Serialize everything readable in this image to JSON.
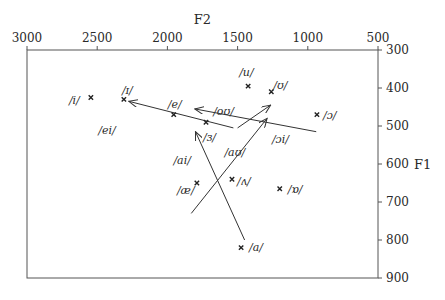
{
  "chart_data": {
    "type": "scatter",
    "title": "",
    "xlabel": "F2",
    "ylabel": "F1",
    "x_axis": {
      "position": "top",
      "reversed": true,
      "range": [
        3000,
        500
      ],
      "ticks": [
        3000,
        2500,
        2000,
        1500,
        1000,
        500
      ]
    },
    "y_axis": {
      "position": "right",
      "reversed": true,
      "range": [
        300,
        900
      ],
      "ticks": [
        300,
        400,
        500,
        600,
        700,
        800,
        900
      ]
    },
    "grid": false,
    "legend": null,
    "vowels": [
      {
        "label": "/i/",
        "F2": 2545,
        "F1": 425,
        "label_dx": -22,
        "label_dy": 6
      },
      {
        "label": "/ɪ/",
        "F2": 2310,
        "F1": 430,
        "label_dx": -2,
        "label_dy": -5
      },
      {
        "label": "/e/",
        "F2": 1955,
        "F1": 470,
        "label_dx": -6,
        "label_dy": -7
      },
      {
        "label": "/ɜ/",
        "F2": 1725,
        "F1": 490,
        "label_dx": -3,
        "label_dy": 19
      },
      {
        "label": "/u/",
        "F2": 1425,
        "F1": 395,
        "label_dx": -9,
        "label_dy": -10
      },
      {
        "label": "/ʊ/",
        "F2": 1260,
        "F1": 410,
        "label_dx": 2,
        "label_dy": -3
      },
      {
        "label": "/ɔ/",
        "F2": 935,
        "F1": 470,
        "label_dx": 6,
        "label_dy": 4
      },
      {
        "label": "/æ/",
        "F2": 1790,
        "F1": 650,
        "label_dx": -20,
        "label_dy": 11
      },
      {
        "label": "/ʌ/",
        "F2": 1540,
        "F1": 640,
        "label_dx": 5,
        "label_dy": 6
      },
      {
        "label": "/ɒ/",
        "F2": 1200,
        "F1": 665,
        "label_dx": 8,
        "label_dy": 4
      },
      {
        "label": "/a/",
        "F2": 1475,
        "F1": 820,
        "label_dx": 8,
        "label_dy": 3
      }
    ],
    "diphthongs": [
      {
        "label": "/ei/",
        "from": {
          "F2": 1530,
          "F1": 505
        },
        "to": {
          "F2": 2275,
          "F1": 435
        },
        "label_pos": {
          "F2": 2430,
          "F1": 520
        }
      },
      {
        "label": "/ai/",
        "from": {
          "F2": 1450,
          "F1": 800
        },
        "to": {
          "F2": 1800,
          "F1": 515
        },
        "label_pos": {
          "F2": 1895,
          "F1": 600
        }
      },
      {
        "label": "/aʊ/",
        "from": {
          "F2": 1830,
          "F1": 730
        },
        "to": {
          "F2": 1290,
          "F1": 480
        },
        "label_pos": {
          "F2": 1520,
          "F1": 580
        }
      },
      {
        "label": "/oʊ/",
        "from": {
          "F2": 1500,
          "F1": 505
        },
        "to": {
          "F2": 1265,
          "F1": 445
        },
        "label_pos": {
          "F2": 1600,
          "F1": 470
        }
      },
      {
        "label": "/ɔi/",
        "from": {
          "F2": 940,
          "F1": 515
        },
        "to": {
          "F2": 1805,
          "F1": 455
        },
        "label_pos": {
          "F2": 1195,
          "F1": 545
        }
      }
    ]
  },
  "axes": {
    "x_title": "F2",
    "y_title": "F1"
  }
}
